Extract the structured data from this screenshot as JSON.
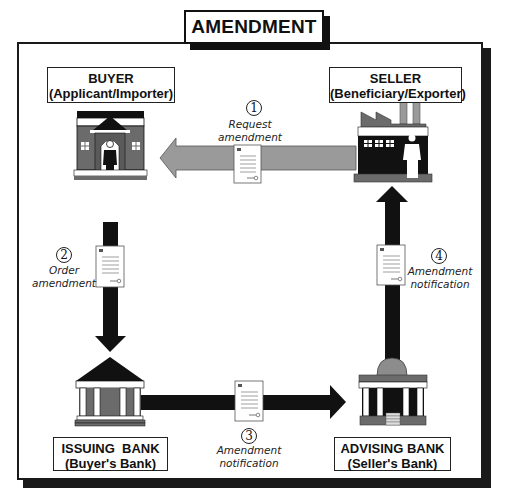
{
  "title": "AMENDMENT",
  "parties": {
    "buyer": {
      "name": "BUYER",
      "role": "(Applicant/Importer)",
      "icon": "house-with-person-icon"
    },
    "seller": {
      "name": "SELLER",
      "role": "(Beneficiary/Exporter)",
      "icon": "factory-with-worker-icon"
    },
    "issuing_bank": {
      "name": "ISSUING  BANK",
      "role": "(Buyer's Bank)",
      "icon": "bank-building-icon"
    },
    "advising_bank": {
      "name": "ADVISING BANK",
      "role": "(Seller's Bank)",
      "icon": "domed-bank-building-icon"
    }
  },
  "steps": [
    {
      "number": "1",
      "label_line1": "Request amendment",
      "label_line2": "",
      "from": "SELLER",
      "to": "BUYER",
      "arrow_color": "#9a9a9a"
    },
    {
      "number": "2",
      "label_line1": "Order",
      "label_line2": "amendment",
      "from": "BUYER",
      "to": "ISSUING BANK",
      "arrow_color": "#111111"
    },
    {
      "number": "3",
      "label_line1": "Amendment",
      "label_line2": "notification",
      "from": "ISSUING BANK",
      "to": "ADVISING BANK",
      "arrow_color": "#111111"
    },
    {
      "number": "4",
      "label_line1": "Amendment",
      "label_line2": "notification",
      "from": "ADVISING BANK",
      "to": "SELLER",
      "arrow_color": "#111111"
    }
  ],
  "colors": {
    "frame": "#1a1a1a",
    "building_gray": "#6b6b6b",
    "light_gray": "#9a9a9a",
    "black": "#111111"
  }
}
